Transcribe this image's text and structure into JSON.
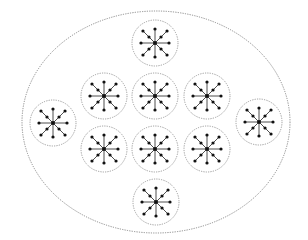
{
  "diagram": {
    "type": "nested-clusters",
    "width": 308,
    "height": 240,
    "colors": {
      "background": "#ffffff",
      "container_stroke": "#8a8a8a",
      "cluster_stroke": "#9a9a9a",
      "spoke": "#222222",
      "node": "#111111"
    },
    "container": {
      "shape": "ellipse",
      "cx": 156,
      "cy": 122,
      "rx": 134,
      "ry": 111,
      "style": "dotted"
    },
    "cluster_radius": 23,
    "star": {
      "spokes": 8,
      "cardinal_length": 14,
      "diagonal_length": 17,
      "diagonal_mid_node": true,
      "node_radius": 1.6,
      "center_radius": 2
    },
    "clusters": [
      {
        "id": "top",
        "cx": 155,
        "cy": 43
      },
      {
        "id": "row2-left",
        "cx": 104,
        "cy": 96
      },
      {
        "id": "row2-center",
        "cx": 155,
        "cy": 96
      },
      {
        "id": "row2-right",
        "cx": 207,
        "cy": 96
      },
      {
        "id": "far-left",
        "cx": 53,
        "cy": 123
      },
      {
        "id": "far-right",
        "cx": 259,
        "cy": 122
      },
      {
        "id": "row3-left",
        "cx": 104,
        "cy": 149
      },
      {
        "id": "row3-center",
        "cx": 155,
        "cy": 149
      },
      {
        "id": "row3-right",
        "cx": 207,
        "cy": 149
      },
      {
        "id": "bottom",
        "cx": 156,
        "cy": 202
      }
    ]
  }
}
